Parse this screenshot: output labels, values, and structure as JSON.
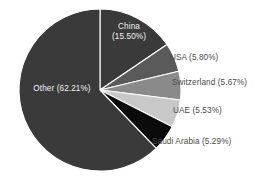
{
  "chart_data": {
    "type": "pie",
    "title": "",
    "subtitle": "",
    "xlabel": "",
    "ylabel": "",
    "legend_position": "none",
    "grid": false,
    "start_angle_deg": 0,
    "direction": "clockwise",
    "center": {
      "x": 100,
      "y": 90
    },
    "radius": 81,
    "categories": [
      "China",
      "USA",
      "Switzerland",
      "UAE",
      "Saudi Arabia",
      "Other"
    ],
    "values": [
      15.5,
      5.8,
      5.67,
      5.53,
      5.29,
      62.21
    ],
    "unit": "%",
    "colors": [
      "#3a3a3a",
      "#5a5a5a",
      "#8a8a8a",
      "#c8c8c8",
      "#0a0a0a",
      "#3a3a3a"
    ],
    "slices": [
      {
        "name": "China",
        "value": 15.5,
        "label": "China",
        "percent_label": "(15.50%)",
        "full_label": "China (15.50%)",
        "color": "#3a3a3a",
        "label_placement": "inside",
        "label_color": "#f2f2f2",
        "start_deg": 0.0,
        "end_deg": 55.8
      },
      {
        "name": "USA",
        "value": 5.8,
        "label": "USA",
        "percent_label": "(5.80%)",
        "full_label": "USA (5.80%)",
        "color": "#5a5a5a",
        "label_placement": "outside",
        "label_color": "#4a4a4a",
        "start_deg": 55.8,
        "end_deg": 76.68
      },
      {
        "name": "Switzerland",
        "value": 5.67,
        "label": "Switzerland",
        "percent_label": "(5.67%)",
        "full_label": "Switzerland (5.67%)",
        "color": "#8a8a8a",
        "label_placement": "outside",
        "label_color": "#4a4a4a",
        "start_deg": 76.68,
        "end_deg": 97.1
      },
      {
        "name": "UAE",
        "value": 5.53,
        "label": "UAE",
        "percent_label": "(5.53%)",
        "full_label": "UAE (5.53%)",
        "color": "#c8c8c8",
        "label_placement": "outside",
        "label_color": "#4a4a4a",
        "start_deg": 97.1,
        "end_deg": 117.01
      },
      {
        "name": "Saudi Arabia",
        "value": 5.29,
        "label": "Saudi Arabia",
        "percent_label": "(5.29%)",
        "full_label": "Saudi Arabia (5.29%)",
        "color": "#0a0a0a",
        "label_placement": "outside",
        "label_color": "#4a4a4a",
        "start_deg": 117.01,
        "end_deg": 136.05
      },
      {
        "name": "Other",
        "value": 62.21,
        "label": "Other",
        "percent_label": "(62.21%)",
        "full_label": "Other (62.21%)",
        "color": "#3a3a3a",
        "label_placement": "inside",
        "label_color": "#f2f2f2",
        "start_deg": 136.05,
        "end_deg": 360.0
      }
    ],
    "background_color": "#ffffff",
    "slice_border_color": "#ffffff"
  },
  "labels": {
    "china_line1": "China",
    "china_line2": "(15.50%)",
    "other": "Other (62.21%)",
    "usa": "USA (5.80%)",
    "switzerland": "Switzerland (5.67%)",
    "uae": "UAE (5.53%)",
    "saudi_arabia": "Saudi Arabia (5.29%)"
  }
}
